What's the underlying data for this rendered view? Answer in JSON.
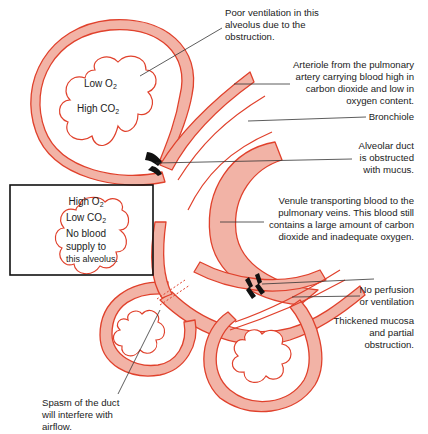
{
  "colors": {
    "vessel_fill": "#f2b3a6",
    "vessel_stroke": "#e0412c",
    "obstruction": "#111111",
    "leader_line": "#333333",
    "background": "#ffffff"
  },
  "upper_alveolus": {
    "line1": "Low O",
    "line1_sub": "2",
    "line2": "High CO",
    "line2_sub": "2"
  },
  "boxed_alveolus": {
    "line1": "High O",
    "line1_sub": "2",
    "line2": "Low CO",
    "line2_sub": "2",
    "line3": "No blood",
    "line4": "supply to",
    "line5": "this alveolus."
  },
  "labels": {
    "poor_ventilation": [
      "Poor ventilation in this",
      "alveolus due to the",
      "obstruction."
    ],
    "arteriole": [
      "Arteriole from the pulmonary",
      "artery carrying blood high in",
      "carbon dioxide and low in",
      "oxygen content."
    ],
    "bronchiole": [
      "Bronchiole"
    ],
    "alveolar_duct": [
      "Alveolar duct",
      "is obstructed",
      "with mucus."
    ],
    "venule": [
      "Venule transporting blood to the",
      "pulmonary veins. This blood still",
      "contains a large amount of carbon",
      "dioxide and inadequate oxygen."
    ],
    "no_perfusion": [
      "No perfusion",
      "or ventilation"
    ],
    "thickened_mucosa": [
      "Thickened mucosa",
      "and partial",
      "obstruction."
    ],
    "spasm": [
      "Spasm of the duct",
      "will interfere with",
      "airflow."
    ]
  }
}
